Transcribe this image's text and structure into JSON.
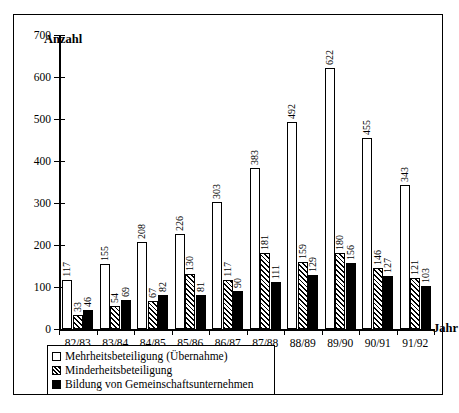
{
  "chart_data": {
    "type": "bar",
    "title": "",
    "xlabel": "Jahr",
    "ylabel": "Anzahl",
    "ylim": [
      0,
      700
    ],
    "yticks": [
      0,
      100,
      200,
      300,
      400,
      500,
      600,
      700
    ],
    "grid": false,
    "legend_position": "bottom-left",
    "categories": [
      "82/83",
      "83/84",
      "84/85",
      "85/86",
      "86/87",
      "87/88",
      "88/89",
      "89/90",
      "90/91",
      "91/92"
    ],
    "series": [
      {
        "name": "Mehrheitsbeteiligung (Übernahme)",
        "fill": "white",
        "values": [
          117,
          155,
          208,
          226,
          303,
          383,
          492,
          622,
          455,
          343
        ]
      },
      {
        "name": "Minderheitsbeteiligung",
        "fill": "hatched",
        "values": [
          33,
          54,
          67,
          130,
          117,
          181,
          159,
          180,
          146,
          121
        ]
      },
      {
        "name": "Bildung von Gemeinschaftsunternehmen",
        "fill": "black",
        "values": [
          46,
          69,
          82,
          81,
          90,
          111,
          129,
          156,
          127,
          103
        ]
      }
    ]
  },
  "legend": {
    "items": [
      {
        "label": "Mehrheitsbeteiligung (Übernahme)",
        "swatch": "mehr"
      },
      {
        "label": "Minderheitsbeteiligung",
        "swatch": "minder"
      },
      {
        "label": "Bildung von Gemeinschaftsunternehmen",
        "swatch": "bildung"
      }
    ]
  }
}
